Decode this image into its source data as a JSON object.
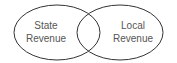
{
  "diagram": {
    "type": "venn",
    "sets": [
      {
        "label_line1": "State",
        "label_line2": "Revenue"
      },
      {
        "label_line1": "Local",
        "label_line2": "Revenue"
      }
    ],
    "colors": {
      "stroke": "#333333",
      "text": "#555555",
      "background": "#ffffff"
    }
  }
}
